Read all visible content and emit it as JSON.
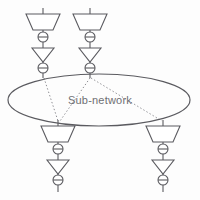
{
  "figure": {
    "background_color": "#fdfdfd",
    "stroke_color": "#5b5b60",
    "label_color": "#6f6f73",
    "width": 200,
    "height": 200
  },
  "subnetwork": {
    "label": "Sub-network",
    "label_x": 100,
    "label_y": 103,
    "ellipse": {
      "cx": 99,
      "cy": 100,
      "rx": 91,
      "ry": 26
    }
  },
  "nodes": [
    {
      "id": "node-top-left",
      "position": "top",
      "x": 43,
      "stem_top_y": 8,
      "attach_y": 78,
      "components": [
        {
          "type": "antenna-trapezoid",
          "name": "antenna",
          "y": 14,
          "top_width": 34,
          "bottom_width": 20,
          "height": 16
        },
        {
          "type": "circle-with-bar",
          "name": "isolator",
          "y": 37,
          "r": 5
        },
        {
          "type": "triangle-down",
          "name": "amplifier",
          "y": 48,
          "width": 22,
          "height": 14
        },
        {
          "type": "circle-with-bar",
          "name": "isolator",
          "y": 68,
          "r": 5
        }
      ]
    },
    {
      "id": "node-top-right",
      "position": "top",
      "x": 90,
      "stem_top_y": 8,
      "attach_y": 78,
      "components": [
        {
          "type": "antenna-trapezoid",
          "name": "antenna",
          "y": 14,
          "top_width": 34,
          "bottom_width": 20,
          "height": 16
        },
        {
          "type": "circle-with-bar",
          "name": "isolator",
          "y": 37,
          "r": 5
        },
        {
          "type": "triangle-down",
          "name": "amplifier",
          "y": 48,
          "width": 22,
          "height": 14
        },
        {
          "type": "circle-with-bar",
          "name": "isolator",
          "y": 68,
          "r": 5
        }
      ]
    },
    {
      "id": "node-bottom-left",
      "position": "bottom",
      "x": 58,
      "stem_top_y": 120,
      "attach_y": 120,
      "components": [
        {
          "type": "antenna-trapezoid",
          "name": "antenna",
          "y": 126,
          "top_width": 34,
          "bottom_width": 20,
          "height": 16
        },
        {
          "type": "circle-with-bar",
          "name": "isolator",
          "y": 149,
          "r": 5
        },
        {
          "type": "triangle-down",
          "name": "amplifier",
          "y": 160,
          "width": 22,
          "height": 14
        },
        {
          "type": "circle-with-bar",
          "name": "isolator",
          "y": 180,
          "r": 5
        }
      ]
    },
    {
      "id": "node-bottom-right",
      "position": "bottom",
      "x": 163,
      "stem_top_y": 120,
      "attach_y": 120,
      "components": [
        {
          "type": "antenna-trapezoid",
          "name": "antenna",
          "y": 126,
          "top_width": 34,
          "bottom_width": 20,
          "height": 16
        },
        {
          "type": "circle-with-bar",
          "name": "isolator",
          "y": 149,
          "r": 5
        },
        {
          "type": "triangle-down",
          "name": "amplifier",
          "y": 160,
          "width": 22,
          "height": 14
        },
        {
          "type": "circle-with-bar",
          "name": "isolator",
          "y": 180,
          "r": 5
        }
      ]
    }
  ],
  "links": [
    {
      "id": "link-topleft-bottomleft",
      "from": "node-top-left",
      "to": "node-bottom-left",
      "x1": 44,
      "y1": 78,
      "x2": 58,
      "y2": 121,
      "style": "dotted"
    },
    {
      "id": "link-topright-bottomleft",
      "from": "node-top-right",
      "to": "node-bottom-left",
      "x1": 90,
      "y1": 78,
      "x2": 60,
      "y2": 121,
      "style": "dotted"
    },
    {
      "id": "link-topright-bottomright",
      "from": "node-top-right",
      "to": "node-bottom-right",
      "x1": 91,
      "y1": 78,
      "x2": 162,
      "y2": 121,
      "style": "dotted"
    }
  ]
}
